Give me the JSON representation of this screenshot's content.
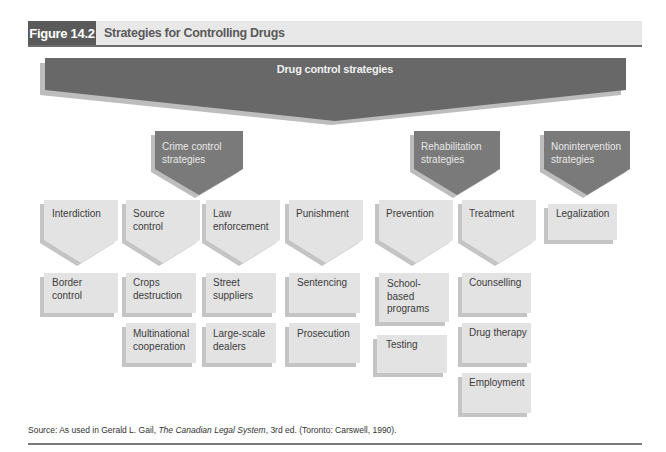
{
  "figure": {
    "label": "Figure 14.2",
    "title": "Strategies for Controlling Drugs"
  },
  "colors": {
    "header_bg": "#e8e8e8",
    "label_bg": "#5a5a5a",
    "root_fill": "#686868",
    "category_fill": "#7a7a7a",
    "node_fill": "#e3e3e3",
    "shadow": "#bdbdbd",
    "rule": "#6e6e6e"
  },
  "root": {
    "label": "Drug control strategies"
  },
  "categories": [
    {
      "label": "Crime control strategies",
      "line1": "Crime control",
      "line2": "strategies"
    },
    {
      "label": "Rehabilitation strategies",
      "line1": "Rehabilitation",
      "line2": "strategies"
    },
    {
      "label": "Nonintervention strategies",
      "line1": "Nonintervention",
      "line2": "strategies"
    }
  ],
  "strategies": [
    {
      "line1": "Interdiction",
      "line2": "",
      "category": "Crime control strategies",
      "children": [
        {
          "line1": "Border",
          "line2": "control",
          "line3": ""
        }
      ]
    },
    {
      "line1": "Source",
      "line2": "control",
      "category": "Crime control strategies",
      "children": [
        {
          "line1": "Crops",
          "line2": "destruction",
          "line3": ""
        },
        {
          "line1": "Multinational",
          "line2": "cooperation",
          "line3": ""
        }
      ]
    },
    {
      "line1": "Law",
      "line2": "enforcement",
      "category": "Crime control strategies",
      "children": [
        {
          "line1": "Street",
          "line2": "suppliers",
          "line3": ""
        },
        {
          "line1": "Large-scale",
          "line2": "dealers",
          "line3": ""
        }
      ]
    },
    {
      "line1": "Punishment",
      "line2": "",
      "category": "Crime control strategies",
      "children": [
        {
          "line1": "Sentencing",
          "line2": "",
          "line3": ""
        },
        {
          "line1": "Prosecution",
          "line2": "",
          "line3": ""
        }
      ]
    },
    {
      "line1": "Prevention",
      "line2": "",
      "category": "Rehabilitation strategies",
      "children": [
        {
          "line1": "School-",
          "line2": "based",
          "line3": "programs"
        },
        {
          "line1": "Testing",
          "line2": "",
          "line3": ""
        }
      ]
    },
    {
      "line1": "Treatment",
      "line2": "",
      "category": "Rehabilitation strategies",
      "children": [
        {
          "line1": "Counselling",
          "line2": "",
          "line3": ""
        },
        {
          "line1": "Drug therapy",
          "line2": "",
          "line3": ""
        },
        {
          "line1": "Employment",
          "line2": "",
          "line3": ""
        }
      ]
    },
    {
      "line1": "Legalization",
      "line2": "",
      "category": "Nonintervention strategies",
      "children": []
    }
  ],
  "source": {
    "prefix": "Source: As used in Gerald L. Gail, ",
    "book_title": "The Canadian Legal System",
    "suffix": ", 3rd ed. (Toronto: Carswell, 1990)."
  }
}
